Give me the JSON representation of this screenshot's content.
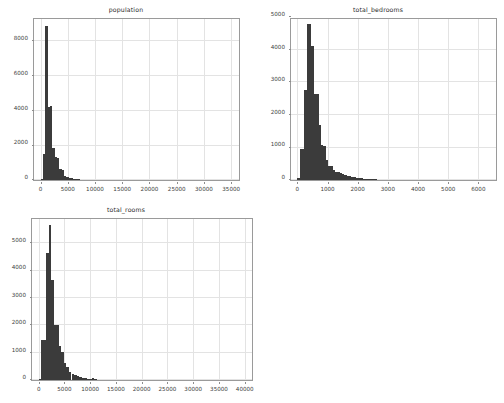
{
  "figure": {
    "background_color": "#ffffff",
    "bar_color": "#3b3b3b",
    "grid_color": "#e3e3e3",
    "axis_color": "#9a9a9a",
    "tick_label_color": "#3c3c3c",
    "layout": "2x2 grid, bottom-right empty"
  },
  "chart_data": [
    {
      "type": "bar",
      "subtype": "histogram",
      "title": "population",
      "xlabel": "",
      "ylabel": "",
      "xlim": [
        -1200,
        36800
      ],
      "ylim": [
        0,
        9400
      ],
      "xticks": [
        0,
        5000,
        10000,
        15000,
        20000,
        25000,
        30000,
        35000
      ],
      "xtick_labels": [
        "0",
        "5000",
        "10000",
        "15000",
        "20000",
        "25000",
        "30000",
        "35000"
      ],
      "yticks": [
        0,
        2000,
        4000,
        6000,
        8000
      ],
      "ytick_labels": [
        "0",
        "2000",
        "4000",
        "6000",
        "8000"
      ],
      "grid": true,
      "legend": null,
      "bin_width": 430,
      "bins": [
        {
          "x0": 0,
          "x1": 430,
          "count": 60
        },
        {
          "x0": 430,
          "x1": 860,
          "count": 1480
        },
        {
          "x0": 860,
          "x1": 1290,
          "count": 8900
        },
        {
          "x0": 1290,
          "x1": 1720,
          "count": 4220
        },
        {
          "x0": 1720,
          "x1": 2150,
          "count": 4250
        },
        {
          "x0": 2150,
          "x1": 2580,
          "count": 1820
        },
        {
          "x0": 2580,
          "x1": 3010,
          "count": 1350
        },
        {
          "x0": 3010,
          "x1": 3440,
          "count": 1280
        },
        {
          "x0": 3440,
          "x1": 3870,
          "count": 640
        },
        {
          "x0": 3870,
          "x1": 4300,
          "count": 600
        },
        {
          "x0": 4300,
          "x1": 4730,
          "count": 260
        },
        {
          "x0": 4730,
          "x1": 5160,
          "count": 200
        },
        {
          "x0": 5160,
          "x1": 5590,
          "count": 130
        },
        {
          "x0": 5590,
          "x1": 6020,
          "count": 90
        },
        {
          "x0": 6020,
          "x1": 6450,
          "count": 60
        },
        {
          "x0": 6450,
          "x1": 6880,
          "count": 40
        },
        {
          "x0": 6880,
          "x1": 7310,
          "count": 30
        },
        {
          "x0": 7310,
          "x1": 7740,
          "count": 20
        },
        {
          "x0": 7740,
          "x1": 8170,
          "count": 14
        },
        {
          "x0": 8170,
          "x1": 8600,
          "count": 10
        },
        {
          "x0": 8600,
          "x1": 9030,
          "count": 8
        },
        {
          "x0": 9030,
          "x1": 9460,
          "count": 6
        },
        {
          "x0": 9460,
          "x1": 9890,
          "count": 5
        },
        {
          "x0": 9890,
          "x1": 10320,
          "count": 4
        },
        {
          "x0": 10320,
          "x1": 10750,
          "count": 3
        },
        {
          "x0": 10750,
          "x1": 11180,
          "count": 3
        },
        {
          "x0": 11180,
          "x1": 11610,
          "count": 2
        },
        {
          "x0": 11610,
          "x1": 12040,
          "count": 2
        },
        {
          "x0": 12040,
          "x1": 12470,
          "count": 2
        },
        {
          "x0": 12470,
          "x1": 12900,
          "count": 1
        },
        {
          "x0": 12900,
          "x1": 13330,
          "count": 1
        },
        {
          "x0": 13330,
          "x1": 13760,
          "count": 1
        },
        {
          "x0": 15050,
          "x1": 15480,
          "count": 1
        },
        {
          "x0": 16340,
          "x1": 16770,
          "count": 1
        },
        {
          "x0": 28380,
          "x1": 28810,
          "count": 1
        },
        {
          "x0": 35000,
          "x1": 35430,
          "count": 1
        }
      ]
    },
    {
      "type": "bar",
      "subtype": "histogram",
      "title": "total_bedrooms",
      "xlabel": "",
      "ylabel": "",
      "xlim": [
        -210,
        6650
      ],
      "ylim": [
        0,
        5000
      ],
      "xticks": [
        0,
        1000,
        2000,
        3000,
        4000,
        5000,
        6000
      ],
      "xtick_labels": [
        "0",
        "1000",
        "2000",
        "3000",
        "4000",
        "5000",
        "6000"
      ],
      "yticks": [
        0,
        1000,
        2000,
        3000,
        4000,
        5000
      ],
      "ytick_labels": [
        "0",
        "1000",
        "2000",
        "3000",
        "4000",
        "5000"
      ],
      "grid": true,
      "legend": null,
      "bin_width": 78,
      "bins": [
        {
          "x0": 0,
          "x1": 78,
          "count": 60
        },
        {
          "x0": 78,
          "x1": 156,
          "count": 960
        },
        {
          "x0": 156,
          "x1": 234,
          "count": 960
        },
        {
          "x0": 234,
          "x1": 312,
          "count": 2750
        },
        {
          "x0": 312,
          "x1": 390,
          "count": 4800
        },
        {
          "x0": 390,
          "x1": 468,
          "count": 4790
        },
        {
          "x0": 468,
          "x1": 546,
          "count": 4100
        },
        {
          "x0": 546,
          "x1": 624,
          "count": 2650
        },
        {
          "x0": 624,
          "x1": 702,
          "count": 2640
        },
        {
          "x0": 702,
          "x1": 780,
          "count": 1700
        },
        {
          "x0": 780,
          "x1": 858,
          "count": 1060
        },
        {
          "x0": 858,
          "x1": 936,
          "count": 1050
        },
        {
          "x0": 936,
          "x1": 1014,
          "count": 620
        },
        {
          "x0": 1014,
          "x1": 1092,
          "count": 440
        },
        {
          "x0": 1092,
          "x1": 1170,
          "count": 430
        },
        {
          "x0": 1170,
          "x1": 1248,
          "count": 300
        },
        {
          "x0": 1248,
          "x1": 1326,
          "count": 260
        },
        {
          "x0": 1326,
          "x1": 1404,
          "count": 240
        },
        {
          "x0": 1404,
          "x1": 1482,
          "count": 200
        },
        {
          "x0": 1482,
          "x1": 1560,
          "count": 170
        },
        {
          "x0": 1560,
          "x1": 1638,
          "count": 150
        },
        {
          "x0": 1638,
          "x1": 1716,
          "count": 130
        },
        {
          "x0": 1716,
          "x1": 1794,
          "count": 110
        },
        {
          "x0": 1794,
          "x1": 1872,
          "count": 90
        },
        {
          "x0": 1872,
          "x1": 1950,
          "count": 80
        },
        {
          "x0": 1950,
          "x1": 2028,
          "count": 70
        },
        {
          "x0": 2028,
          "x1": 2106,
          "count": 60
        },
        {
          "x0": 2106,
          "x1": 2184,
          "count": 50
        },
        {
          "x0": 2184,
          "x1": 2262,
          "count": 42
        },
        {
          "x0": 2262,
          "x1": 2340,
          "count": 36
        },
        {
          "x0": 2340,
          "x1": 2418,
          "count": 30
        },
        {
          "x0": 2418,
          "x1": 2496,
          "count": 24
        },
        {
          "x0": 2496,
          "x1": 2574,
          "count": 20
        },
        {
          "x0": 2574,
          "x1": 2652,
          "count": 16
        },
        {
          "x0": 2652,
          "x1": 2730,
          "count": 13
        },
        {
          "x0": 2730,
          "x1": 2808,
          "count": 10
        },
        {
          "x0": 2808,
          "x1": 2886,
          "count": 8
        },
        {
          "x0": 2886,
          "x1": 2964,
          "count": 7
        },
        {
          "x0": 2964,
          "x1": 3042,
          "count": 6
        },
        {
          "x0": 3042,
          "x1": 3120,
          "count": 5
        },
        {
          "x0": 3120,
          "x1": 3198,
          "count": 4
        },
        {
          "x0": 3198,
          "x1": 3276,
          "count": 3
        },
        {
          "x0": 3276,
          "x1": 3354,
          "count": 3
        },
        {
          "x0": 3354,
          "x1": 3432,
          "count": 2
        },
        {
          "x0": 3432,
          "x1": 3510,
          "count": 2
        },
        {
          "x0": 3666,
          "x1": 3744,
          "count": 2
        },
        {
          "x0": 3900,
          "x1": 3978,
          "count": 1
        },
        {
          "x0": 4290,
          "x1": 4368,
          "count": 1
        },
        {
          "x0": 4680,
          "x1": 4758,
          "count": 1
        },
        {
          "x0": 5226,
          "x1": 5304,
          "count": 1
        },
        {
          "x0": 6210,
          "x1": 6288,
          "count": 1
        }
      ]
    },
    {
      "type": "bar",
      "subtype": "histogram",
      "title": "total_rooms",
      "xlabel": "",
      "ylabel": "",
      "xlim": [
        -1300,
        41800
      ],
      "ylim": [
        0,
        5950
      ],
      "xticks": [
        0,
        5000,
        10000,
        15000,
        20000,
        25000,
        30000,
        35000,
        40000
      ],
      "xtick_labels": [
        "0",
        "5000",
        "10000",
        "15000",
        "20000",
        "25000",
        "30000",
        "35000",
        "40000"
      ],
      "yticks": [
        0,
        1000,
        2000,
        3000,
        4000,
        5000
      ],
      "ytick_labels": [
        "0",
        "1000",
        "2000",
        "3000",
        "4000",
        "5000"
      ],
      "grid": true,
      "legend": null,
      "bin_width": 490,
      "bins": [
        {
          "x0": 0,
          "x1": 490,
          "count": 40
        },
        {
          "x0": 490,
          "x1": 980,
          "count": 1460
        },
        {
          "x0": 980,
          "x1": 1470,
          "count": 1450
        },
        {
          "x0": 1470,
          "x1": 1960,
          "count": 4650
        },
        {
          "x0": 1960,
          "x1": 2450,
          "count": 5650
        },
        {
          "x0": 2450,
          "x1": 2940,
          "count": 3650
        },
        {
          "x0": 2940,
          "x1": 3430,
          "count": 2020
        },
        {
          "x0": 3430,
          "x1": 3920,
          "count": 2010
        },
        {
          "x0": 3920,
          "x1": 4410,
          "count": 1250
        },
        {
          "x0": 4410,
          "x1": 4900,
          "count": 1020
        },
        {
          "x0": 4900,
          "x1": 5390,
          "count": 620
        },
        {
          "x0": 5390,
          "x1": 5880,
          "count": 460
        },
        {
          "x0": 5880,
          "x1": 6370,
          "count": 300
        },
        {
          "x0": 6370,
          "x1": 6860,
          "count": 230
        },
        {
          "x0": 6860,
          "x1": 7350,
          "count": 170
        },
        {
          "x0": 7350,
          "x1": 7840,
          "count": 130
        },
        {
          "x0": 7840,
          "x1": 8330,
          "count": 100
        },
        {
          "x0": 8330,
          "x1": 8820,
          "count": 80
        },
        {
          "x0": 8820,
          "x1": 9310,
          "count": 60
        },
        {
          "x0": 9310,
          "x1": 9800,
          "count": 48
        },
        {
          "x0": 9800,
          "x1": 10290,
          "count": 40
        },
        {
          "x0": 10290,
          "x1": 10780,
          "count": 70
        },
        {
          "x0": 10780,
          "x1": 11270,
          "count": 22
        },
        {
          "x0": 11270,
          "x1": 11760,
          "count": 18
        },
        {
          "x0": 11760,
          "x1": 12250,
          "count": 14
        },
        {
          "x0": 12250,
          "x1": 12740,
          "count": 11
        },
        {
          "x0": 12740,
          "x1": 13230,
          "count": 9
        },
        {
          "x0": 13230,
          "x1": 13720,
          "count": 7
        },
        {
          "x0": 13720,
          "x1": 14210,
          "count": 6
        },
        {
          "x0": 14210,
          "x1": 14700,
          "count": 5
        },
        {
          "x0": 14700,
          "x1": 15190,
          "count": 4
        },
        {
          "x0": 15190,
          "x1": 15680,
          "count": 3
        },
        {
          "x0": 15680,
          "x1": 16170,
          "count": 3
        },
        {
          "x0": 16170,
          "x1": 16660,
          "count": 2
        },
        {
          "x0": 16660,
          "x1": 17150,
          "count": 2
        },
        {
          "x0": 17640,
          "x1": 18130,
          "count": 2
        },
        {
          "x0": 18620,
          "x1": 19110,
          "count": 1
        },
        {
          "x0": 19600,
          "x1": 20090,
          "count": 1
        },
        {
          "x0": 21560,
          "x1": 22050,
          "count": 1
        },
        {
          "x0": 25480,
          "x1": 25970,
          "count": 1
        },
        {
          "x0": 30380,
          "x1": 30870,
          "count": 1
        },
        {
          "x0": 32340,
          "x1": 32830,
          "count": 1
        },
        {
          "x0": 39200,
          "x1": 39690,
          "count": 1
        }
      ]
    }
  ]
}
